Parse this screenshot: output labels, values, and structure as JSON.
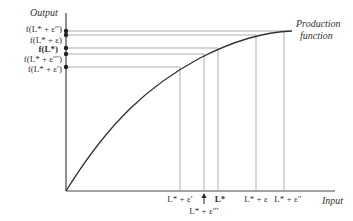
{
  "axes": {
    "y_label": "Output",
    "x_label": "Input"
  },
  "curve": {
    "label_line1": "Production",
    "label_line2": "function"
  },
  "y_ticks": [
    {
      "label": "f(L* + ε′′)",
      "y": 31
    },
    {
      "label": "f(L* + ε)",
      "y": 35
    },
    {
      "label": "f(L*)",
      "y": 48
    },
    {
      "label": "f(L* + ε′′′)",
      "y": 54
    },
    {
      "label": "f(L* + ε′)",
      "y": 67
    }
  ],
  "x_ticks": [
    {
      "label": "L* + ε′",
      "x": 180
    },
    {
      "label": "L* + ε′′′",
      "x": 204
    },
    {
      "label": "L*",
      "x": 218
    },
    {
      "label": "L* + ε",
      "x": 256
    },
    {
      "label": "L* + ε′′",
      "x": 284
    }
  ],
  "colors": {
    "axis": "#444444",
    "guide": "#999999",
    "curve": "#333333"
  }
}
